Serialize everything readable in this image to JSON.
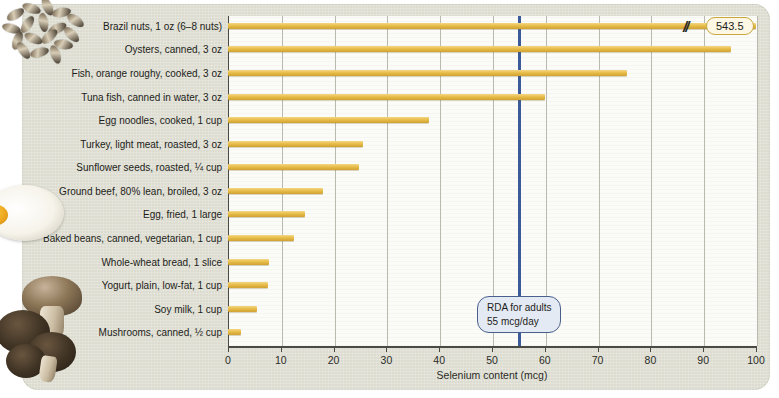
{
  "chart_data": {
    "type": "bar",
    "orientation": "horizontal",
    "title": "",
    "xlabel": "Selenium content (mcg)",
    "ylabel": "",
    "xlim": [
      0,
      100
    ],
    "xticks": [
      0,
      10,
      20,
      30,
      40,
      50,
      60,
      70,
      80,
      90,
      100
    ],
    "xtick_labels": [
      "0",
      "10",
      "20",
      "30",
      "40",
      "50",
      "60",
      "70",
      "80",
      "90",
      "100"
    ],
    "grid": "vertical",
    "legend": "none",
    "bar_color": "#e8bd4a",
    "categories": [
      "Brazil nuts, 1 oz (6–8 nuts)",
      "Oysters, canned, 3 oz",
      "Fish, orange roughy, cooked, 3 oz",
      "Tuna fish, canned in water, 3 oz",
      "Egg noodles, cooked, 1 cup",
      "Turkey, light meat, roasted, 3 oz",
      "Sunflower seeds, roasted, ¼ cup",
      "Ground beef, 80% lean, broiled, 3 oz",
      "Egg, fried, 1 large",
      "Baked beans, canned, vegetarian, 1 cup",
      "Whole-wheat bread, 1 slice",
      "Yogurt, plain, low-fat, 1 cup",
      "Soy milk, 1 cup",
      "Mushrooms, canned, ½ cup"
    ],
    "values": [
      543.5,
      95.2,
      75.6,
      60.0,
      38.0,
      25.5,
      24.8,
      18.0,
      14.5,
      12.5,
      7.8,
      7.5,
      5.5,
      2.5
    ],
    "truncated_bar": {
      "category": "Brazil nuts, 1 oz (6–8 nuts)",
      "label": "543.5",
      "break_symbol": "//",
      "drawn_to": 100
    },
    "reference_line": {
      "value": 55,
      "color": "#3b5a9a",
      "label_line1": "RDA for adults",
      "label_line2": "55 mcg/day"
    }
  },
  "annotations": {
    "callout_value": "543.5",
    "break_symbol": "//",
    "rda_line1": "RDA for adults",
    "rda_line2": "55 mcg/day"
  },
  "decorations": [
    {
      "name": "sunflower-seeds-photo"
    },
    {
      "name": "fried-egg-photo"
    },
    {
      "name": "mushrooms-photo"
    }
  ]
}
